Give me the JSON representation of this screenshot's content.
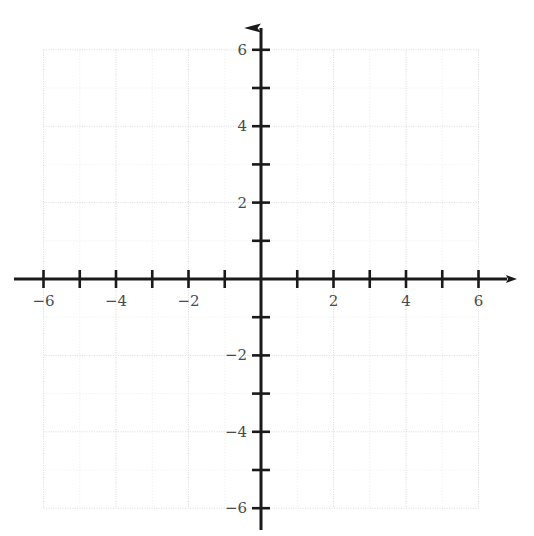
{
  "figure": {
    "type": "coordinate-plane",
    "title": "",
    "width": 534,
    "height": 536,
    "background_color": "#ffffff"
  },
  "colors": {
    "axis": "#1a1a1a",
    "grid_major": "#d8d8de",
    "grid_minor": "#ececed",
    "tick_label": "#4a4a4a",
    "background": "#ffffff"
  },
  "geometry": {
    "origin_px": {
      "x": 261,
      "y": 279
    },
    "unit_px": {
      "x": 36.25,
      "y": 38.2
    },
    "grid_extent_units": {
      "xmin": -6,
      "xmax": 6,
      "ymin": -6,
      "ymax": 6
    },
    "axis_extent_px": {
      "x_start": 14,
      "x_end": 520,
      "y_start": 10,
      "y_end": 530
    },
    "tick_half_length_px": 9,
    "axis_stroke_width": 3,
    "grid_stroke_width": 1
  },
  "chart_data": {
    "type": "scatter",
    "title": "",
    "xlabel": "",
    "ylabel": "",
    "xlim": [
      -6,
      6
    ],
    "ylim": [
      -6,
      6
    ],
    "grid": true,
    "legend": null,
    "series": [],
    "x_ticks": [
      -6,
      -5,
      -4,
      -3,
      -2,
      -1,
      0,
      1,
      2,
      3,
      4,
      5,
      6
    ],
    "y_ticks": [
      -6,
      -5,
      -4,
      -3,
      -2,
      -1,
      0,
      1,
      2,
      3,
      4,
      5,
      6
    ],
    "x_tick_labels_shown": [
      {
        "value": -6,
        "text": "−6"
      },
      {
        "value": -4,
        "text": "−4"
      },
      {
        "value": -2,
        "text": "−2"
      },
      {
        "value": 2,
        "text": "2"
      },
      {
        "value": 4,
        "text": "4"
      },
      {
        "value": 6,
        "text": "6"
      }
    ],
    "y_tick_labels_shown": [
      {
        "value": 6,
        "text": "6"
      },
      {
        "value": 4,
        "text": "4"
      },
      {
        "value": 2,
        "text": "2"
      },
      {
        "value": -2,
        "text": "−2"
      },
      {
        "value": -4,
        "text": "−4"
      },
      {
        "value": -6,
        "text": "−6"
      }
    ],
    "annotations": [],
    "arrows": {
      "x_positive": true,
      "x_negative": false,
      "y_positive": true,
      "y_negative": false
    }
  },
  "axes": {
    "x_axis_name": "x-axis",
    "y_axis_name": "y-axis"
  }
}
